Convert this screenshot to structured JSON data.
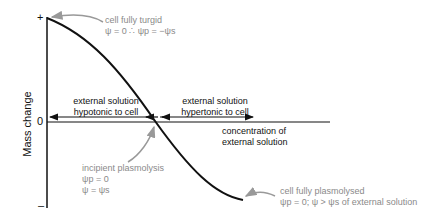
{
  "axes": {
    "y_label": "Mass change",
    "y_plus": "+",
    "y_zero": "0",
    "y_minus": "–",
    "x_label_line1": "concentration of",
    "x_label_line2": "external solution"
  },
  "regions": {
    "hypotonic_line1": "external solution",
    "hypotonic_line2": "hypotonic to cell",
    "hypertonic_line1": "external solution",
    "hypertonic_line2": "hypertonic to cell"
  },
  "annotations": {
    "turgid_title": "cell fully turgid",
    "turgid_eq": "ψ = 0 ∴ ψp = −ψs",
    "incipient_title": "incipient plasmolysis",
    "incipient_eq1": "ψp = 0",
    "incipient_eq2": "ψ = ψs",
    "plasmolysed_title": "cell fully plasmolysed",
    "plasmolysed_eq": "ψp = 0; ψ > ψs of external solution"
  },
  "colors": {
    "line": "#111111",
    "annotation": "#8a8a8a"
  }
}
